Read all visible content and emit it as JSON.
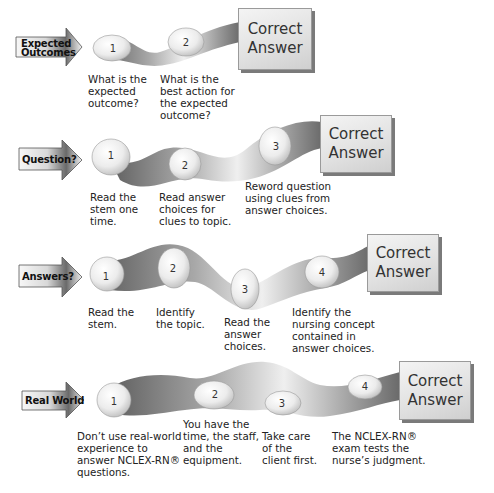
{
  "diagram": {
    "box_label_line1": "Correct",
    "box_label_line2": "Answer",
    "colors": {
      "ribbon_dark": "#6e6e6e",
      "ribbon_light": "#f2f2f2",
      "stone": "#eeeeee",
      "box": "#e4e4e4",
      "arrow_dark": "#555555",
      "arrow_light": "#f4f4f4"
    }
  },
  "sections": [
    {
      "label_line1": "Expected",
      "label_line2": "Outcomes",
      "steps": [
        {
          "number": "1",
          "caption": "What is the\nexpected\noutcome?"
        },
        {
          "number": "2",
          "caption": "What is the\nbest action for\nthe expected\noutcome?"
        }
      ]
    },
    {
      "label_line1": "Question?",
      "steps": [
        {
          "number": "1",
          "caption": "Read the\nstem one\ntime."
        },
        {
          "number": "2",
          "caption": "Read answer\nchoices for\nclues to topic."
        },
        {
          "number": "3",
          "caption": "Reword question\nusing clues from\nanswer choices."
        }
      ]
    },
    {
      "label_line1": "Answers?",
      "steps": [
        {
          "number": "1",
          "caption": "Read the\nstem."
        },
        {
          "number": "2",
          "caption": "Identify\nthe topic."
        },
        {
          "number": "3",
          "caption": "Read the\nanswer\nchoices."
        },
        {
          "number": "4",
          "caption": "Identify the\nnursing concept\ncontained in\nanswer choices."
        }
      ]
    },
    {
      "label_line1": "Real World",
      "steps": [
        {
          "number": "1",
          "caption": "Don’t use real-world\nexperience to\nanswer NCLEX-RN®\nquestions."
        },
        {
          "number": "2",
          "caption": "You have the\ntime, the staff,\nand the\nequipment."
        },
        {
          "number": "3",
          "caption": "Take care\nof the\nclient first."
        },
        {
          "number": "4",
          "caption": "The NCLEX-RN®\nexam tests the\nnurse’s judgment."
        }
      ]
    }
  ]
}
